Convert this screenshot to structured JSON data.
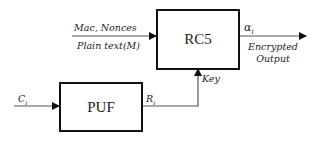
{
  "diagram": {
    "blocks": {
      "rc5": {
        "label": "RC5"
      },
      "puf": {
        "label": "PUF"
      }
    },
    "inputs": {
      "top_line1": "Mac, Nonces",
      "top_line2": "Plain text(M)",
      "challenge": "C",
      "challenge_sub": "i"
    },
    "signals": {
      "response": "R",
      "response_sub": "i",
      "key": "Key",
      "output_symbol": "α",
      "output_sub": "i",
      "output_line1": "Encrypted",
      "output_line2": "Output"
    },
    "colors": {
      "stroke": "#111111",
      "text": "#222222"
    }
  }
}
